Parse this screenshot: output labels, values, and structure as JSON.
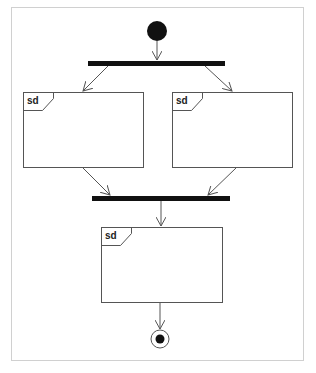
{
  "diagram": {
    "type": "uml-activity-diagram",
    "colors": {
      "background": "#ffffff",
      "frame_border": "#d0d0d0",
      "stroke": "#555555",
      "fill_dark": "#111111"
    },
    "initial_node": {
      "cx": 157,
      "cy": 31,
      "r": 10
    },
    "fork_bar": {
      "x": 88,
      "y": 61,
      "w": 137,
      "h": 5
    },
    "join_bar": {
      "x": 92,
      "y": 196,
      "w": 138,
      "h": 5
    },
    "frames": [
      {
        "id": "left",
        "tag": "sd",
        "x": 23,
        "y": 92,
        "w": 120,
        "h": 75
      },
      {
        "id": "right",
        "tag": "sd",
        "x": 172,
        "y": 92,
        "w": 120,
        "h": 75
      },
      {
        "id": "bottom",
        "tag": "sd",
        "x": 101,
        "y": 227,
        "w": 121,
        "h": 75
      }
    ],
    "final_node": {
      "cx": 160,
      "cy": 339,
      "r_outer": 9,
      "r_inner": 4
    }
  }
}
